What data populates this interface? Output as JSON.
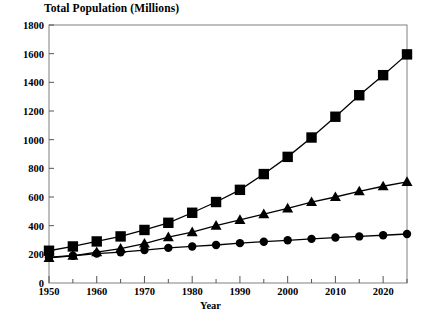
{
  "chart_data": {
    "type": "line",
    "title": "Total Population (Millions)",
    "xlabel": "Year",
    "ylabel": "",
    "xlim": [
      1950,
      2025
    ],
    "ylim": [
      0,
      1800
    ],
    "ytick_step": 200,
    "xtick_step": 10,
    "x_minor_step": 5,
    "grid": false,
    "legend": "none",
    "x": [
      1950,
      1955,
      1960,
      1965,
      1970,
      1975,
      1980,
      1985,
      1990,
      1995,
      2000,
      2005,
      2010,
      2015,
      2020,
      2025
    ],
    "series": [
      {
        "name": "square-series",
        "marker": "square",
        "color": "#000000",
        "values": [
          225,
          255,
          290,
          325,
          370,
          420,
          490,
          565,
          650,
          760,
          880,
          1015,
          1160,
          1310,
          1450,
          1595
        ]
      },
      {
        "name": "triangle-series",
        "marker": "triangle",
        "color": "#000000",
        "values": [
          175,
          190,
          215,
          240,
          275,
          320,
          355,
          400,
          440,
          480,
          520,
          565,
          600,
          640,
          675,
          705
        ]
      },
      {
        "name": "circle-series",
        "marker": "circle",
        "color": "#000000",
        "values": [
          180,
          190,
          205,
          215,
          230,
          245,
          255,
          265,
          278,
          288,
          298,
          308,
          317,
          325,
          333,
          342
        ]
      }
    ],
    "ytick_labels": [
      "0",
      "200",
      "400",
      "600",
      "800",
      "1000",
      "1200",
      "1400",
      "1600",
      "1800"
    ],
    "ytick_values": [
      0,
      200,
      400,
      600,
      800,
      1000,
      1200,
      1400,
      1600,
      1800
    ],
    "xtick_labels": [
      "1950",
      "1960",
      "1970",
      "1980",
      "1990",
      "2000",
      "2010",
      "2020"
    ],
    "xtick_values": [
      1950,
      1960,
      1970,
      1980,
      1990,
      2000,
      2010,
      2020
    ],
    "axis_color": "#808080",
    "tick_color": "#555555"
  }
}
